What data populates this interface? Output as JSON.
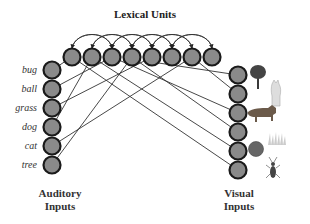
{
  "title": "Lexical Units",
  "auditory": {
    "label_line1": "Auditory",
    "label_line2": "Inputs",
    "words": [
      "bug",
      "ball",
      "grass",
      "dog",
      "cat",
      "tree"
    ]
  },
  "visual": {
    "label_line1": "Visual",
    "label_line2": "Inputs",
    "images": [
      "tree",
      "cat",
      "dog",
      "grass",
      "ball",
      "bug"
    ]
  },
  "lexical_units_count": 8,
  "colors": {
    "node_fill": "#8a8a8a",
    "node_stroke": "#1a1a1a",
    "line": "#333333"
  }
}
